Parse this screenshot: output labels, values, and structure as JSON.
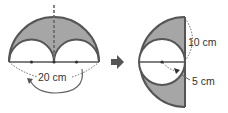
{
  "diagram": {
    "left_figure": {
      "description": "Large semicircle with two small semicircles removed; shaded region between",
      "label_diameter": "20 cm"
    },
    "arrow": "right-arrow",
    "right_figure": {
      "description": "Rearranged into half circle with inscribed circle; shaded region",
      "label_big_radius": "10 cm",
      "label_small_radius": "5 cm"
    },
    "colors": {
      "shade": "#a6a6a6",
      "stroke": "#555555",
      "arrow": "#555555"
    }
  }
}
